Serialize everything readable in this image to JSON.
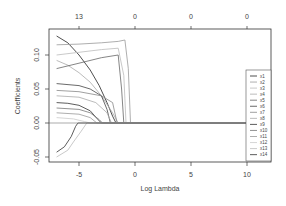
{
  "chart_data": {
    "type": "line",
    "title": "",
    "xlabel": "Log Lambda",
    "ylabel": "Coefficients",
    "xlim": [
      -7.5,
      12.5
    ],
    "ylim": [
      -0.06,
      0.135
    ],
    "x_ticks": [
      -5,
      0,
      5,
      10
    ],
    "y_ticks": [
      -0.05,
      0.0,
      0.05,
      0.1
    ],
    "y_tick_labels": [
      "-0.05",
      "0.00",
      "0.05",
      "0.10"
    ],
    "top_axis": {
      "positions": [
        -5,
        0,
        5,
        10
      ],
      "labels": [
        "13",
        "0",
        "0",
        "0"
      ]
    },
    "grid": false,
    "legend_position": "right",
    "series": [
      {
        "name": "x1",
        "color": "#222222",
        "points": [
          [
            -7,
            0.128
          ],
          [
            -6,
            0.118
          ],
          [
            -5,
            0.1
          ],
          [
            -4,
            0.078
          ],
          [
            -3.2,
            0.055
          ],
          [
            -2.5,
            0.03
          ],
          [
            -2,
            0.01
          ],
          [
            -1.7,
            0
          ]
        ]
      },
      {
        "name": "x2",
        "color": "#999999",
        "points": [
          [
            -7,
            0.115
          ],
          [
            -5,
            0.116
          ],
          [
            -3,
            0.118
          ],
          [
            -1.5,
            0.12
          ],
          [
            -0.9,
            0.122
          ],
          [
            -0.6,
            0.08
          ],
          [
            -0.4,
            0
          ]
        ]
      },
      {
        "name": "x3",
        "color": "#bbbbbb",
        "points": [
          [
            -7,
            0.1
          ],
          [
            -5,
            0.104
          ],
          [
            -3,
            0.108
          ],
          [
            -1.5,
            0.11
          ],
          [
            -1,
            0.07
          ],
          [
            -0.8,
            0
          ]
        ]
      },
      {
        "name": "x4",
        "color": "#aaaaaa",
        "points": [
          [
            -7,
            0.092
          ],
          [
            -6,
            0.085
          ],
          [
            -5,
            0.074
          ],
          [
            -4,
            0.06
          ],
          [
            -3,
            0.04
          ],
          [
            -2,
            0.015
          ],
          [
            -1.5,
            0
          ]
        ]
      },
      {
        "name": "x5",
        "color": "#666666",
        "points": [
          [
            -7,
            0.08
          ],
          [
            -5,
            0.088
          ],
          [
            -3,
            0.096
          ],
          [
            -1.5,
            0.1
          ],
          [
            -1.2,
            0.05
          ],
          [
            -1.0,
            0
          ]
        ]
      },
      {
        "name": "x6",
        "color": "#444444",
        "points": [
          [
            -7,
            0.058
          ],
          [
            -5,
            0.055
          ],
          [
            -4,
            0.05
          ],
          [
            -3,
            0.04
          ],
          [
            -2.5,
            0.02
          ],
          [
            -2.2,
            0
          ]
        ]
      },
      {
        "name": "x7",
        "color": "#888888",
        "points": [
          [
            -7,
            0.048
          ],
          [
            -5,
            0.046
          ],
          [
            -3,
            0.04
          ],
          [
            -2,
            0.03
          ],
          [
            -1.6,
            0
          ]
        ]
      },
      {
        "name": "x8",
        "color": "#aaaaaa",
        "points": [
          [
            -7,
            0.04
          ],
          [
            -5,
            0.038
          ],
          [
            -3.5,
            0.03
          ],
          [
            -2.5,
            0.015
          ],
          [
            -2.1,
            0
          ]
        ]
      },
      {
        "name": "x9",
        "color": "#333333",
        "points": [
          [
            -7,
            0.03
          ],
          [
            -6,
            0.029
          ],
          [
            -5,
            0.026
          ],
          [
            -4,
            0.018
          ],
          [
            -3.3,
            0.005
          ],
          [
            -3,
            0
          ]
        ]
      },
      {
        "name": "x10",
        "color": "#777777",
        "points": [
          [
            -7,
            0.022
          ],
          [
            -5,
            0.02
          ],
          [
            -4,
            0.015
          ],
          [
            -3.2,
            0.005
          ],
          [
            -2.9,
            0
          ]
        ]
      },
      {
        "name": "x11",
        "color": "#999999",
        "points": [
          [
            -7,
            0.015
          ],
          [
            -5,
            0.013
          ],
          [
            -4,
            0.008
          ],
          [
            -3.4,
            0
          ]
        ]
      },
      {
        "name": "x12",
        "color": "#cccccc",
        "points": [
          [
            -7,
            0.008
          ],
          [
            -5.5,
            0.006
          ],
          [
            -4.5,
            0.002
          ],
          [
            -4,
            0
          ]
        ]
      },
      {
        "name": "x13",
        "color": "#bbbbbb",
        "points": [
          [
            -7,
            -0.05
          ],
          [
            -6,
            -0.04
          ],
          [
            -5.5,
            -0.028
          ],
          [
            -4.8,
            -0.012
          ],
          [
            -4.3,
            0
          ]
        ]
      },
      {
        "name": "x14",
        "color": "#333333",
        "points": [
          [
            -7,
            -0.043
          ],
          [
            -6.3,
            -0.035
          ],
          [
            -5.7,
            -0.02
          ],
          [
            -5.3,
            -0.005
          ],
          [
            -5.1,
            0
          ]
        ]
      }
    ]
  },
  "axes": {
    "xlabel": "Log Lambda",
    "ylabel": "Coefficients",
    "x_tick_labels": [
      "-5",
      "0",
      "5",
      "10"
    ],
    "y_tick_labels": [
      "-0.05",
      "0.00",
      "0.05",
      "0.10"
    ],
    "top_tick_labels": [
      "13",
      "0",
      "0",
      "0"
    ]
  },
  "legend": {
    "items": [
      "x1",
      "x2",
      "x3",
      "x4",
      "x5",
      "x6",
      "x7",
      "x8",
      "x9",
      "x10",
      "x11",
      "x12",
      "x13",
      "x14"
    ]
  }
}
